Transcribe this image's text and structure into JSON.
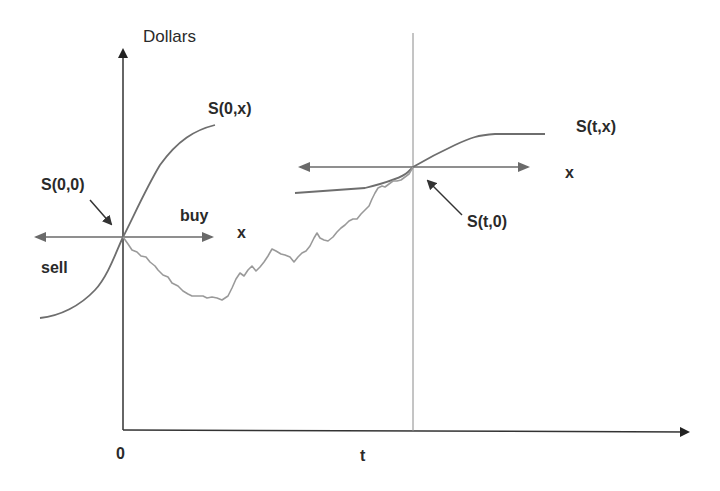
{
  "diagram": {
    "y_axis_label": "Dollars",
    "x_axis_ticks": {
      "origin": "0",
      "t": "t"
    },
    "labels": {
      "s00": "S(0,0)",
      "s0x": "S(0,x)",
      "stx": "S(t,x)",
      "st0": "S(t,0)",
      "buy": "buy",
      "sell": "sell",
      "x_left": "x",
      "x_right": "x"
    },
    "colors": {
      "axis": "#333333",
      "curve": "#6e6e6e",
      "random_path": "#9a9a9a",
      "vertical_t_line": "#8a8a8a",
      "arrows": "#6a6a6a",
      "text": "#2a2a2a"
    },
    "curves": {
      "s0x_curve": "supply curve at time 0 passing through S(0,0)",
      "stx_curve": "supply curve at time t passing through S(t,0)",
      "random_path": "stochastic price path S(u,0) from 0 to t"
    }
  }
}
